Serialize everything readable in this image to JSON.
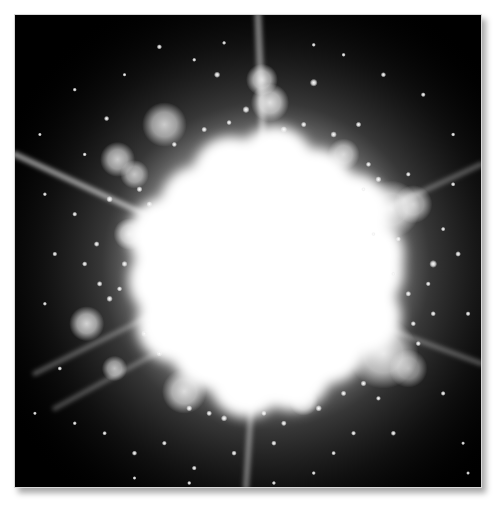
{
  "image": {
    "subject": "bright star cluster core with diffraction spikes",
    "palette": "grayscale",
    "frame": {
      "border_color": "#d8d8d8",
      "background": "#000000",
      "page_background": "#ffffff"
    },
    "core": {
      "cx": 252,
      "cy": 258,
      "radius": 118,
      "color": "#ffffff"
    },
    "glow": {
      "cx": 252,
      "cy": 252,
      "radius": 300
    },
    "spikes": [
      {
        "name": "spike-top",
        "x1": 244,
        "y1": 0,
        "x2": 250,
        "y2": 150,
        "width": 7,
        "opacity": 0.45
      },
      {
        "name": "spike-bottom",
        "x1": 232,
        "y1": 474,
        "x2": 240,
        "y2": 350,
        "width": 6,
        "opacity": 0.4
      },
      {
        "name": "spike-left-upper",
        "x1": 0,
        "y1": 140,
        "x2": 130,
        "y2": 200,
        "width": 6,
        "opacity": 0.55
      },
      {
        "name": "spike-left-lower-1",
        "x1": 20,
        "y1": 360,
        "x2": 140,
        "y2": 300,
        "width": 5,
        "opacity": 0.3
      },
      {
        "name": "spike-left-lower-2",
        "x1": 40,
        "y1": 395,
        "x2": 150,
        "y2": 335,
        "width": 5,
        "opacity": 0.28
      },
      {
        "name": "spike-right-upper",
        "x1": 468,
        "y1": 150,
        "x2": 360,
        "y2": 200,
        "width": 5,
        "opacity": 0.3
      },
      {
        "name": "spike-right-lower",
        "x1": 468,
        "y1": 350,
        "x2": 360,
        "y2": 310,
        "width": 5,
        "opacity": 0.3
      }
    ],
    "blobs": [
      {
        "cx": 248,
        "cy": 65,
        "r": 10,
        "o": 0.8
      },
      {
        "cx": 256,
        "cy": 88,
        "r": 12,
        "o": 0.85
      },
      {
        "cx": 103,
        "cy": 145,
        "r": 11,
        "o": 0.75
      },
      {
        "cx": 120,
        "cy": 160,
        "r": 9,
        "o": 0.7
      },
      {
        "cx": 378,
        "cy": 195,
        "r": 18,
        "o": 0.85
      },
      {
        "cx": 400,
        "cy": 190,
        "r": 12,
        "o": 0.7
      },
      {
        "cx": 345,
        "cy": 240,
        "r": 10,
        "o": 0.8
      },
      {
        "cx": 370,
        "cy": 340,
        "r": 22,
        "o": 0.85
      },
      {
        "cx": 395,
        "cy": 355,
        "r": 12,
        "o": 0.6
      },
      {
        "cx": 72,
        "cy": 310,
        "r": 11,
        "o": 0.8
      },
      {
        "cx": 100,
        "cy": 355,
        "r": 8,
        "o": 0.7
      },
      {
        "cx": 170,
        "cy": 378,
        "r": 14,
        "o": 0.8
      },
      {
        "cx": 290,
        "cy": 388,
        "r": 9,
        "o": 0.75
      },
      {
        "cx": 150,
        "cy": 110,
        "r": 14,
        "o": 0.75
      },
      {
        "cx": 330,
        "cy": 140,
        "r": 10,
        "o": 0.7
      },
      {
        "cx": 115,
        "cy": 220,
        "r": 10,
        "o": 0.8
      }
    ],
    "stars": [
      [
        145,
        32,
        1.5
      ],
      [
        180,
        45,
        1.2
      ],
      [
        203,
        60,
        1.8
      ],
      [
        232,
        95,
        2
      ],
      [
        92,
        104,
        1.5
      ],
      [
        60,
        75,
        1.2
      ],
      [
        300,
        68,
        2.2
      ],
      [
        330,
        40,
        1.2
      ],
      [
        370,
        60,
        1.5
      ],
      [
        410,
        80,
        1.4
      ],
      [
        440,
        120,
        1.2
      ],
      [
        420,
        250,
        2.2
      ],
      [
        445,
        240,
        1.6
      ],
      [
        455,
        300,
        1.4
      ],
      [
        420,
        300,
        1.5
      ],
      [
        395,
        280,
        1.6
      ],
      [
        380,
        260,
        1.5
      ],
      [
        405,
        330,
        1.5
      ],
      [
        430,
        380,
        1.4
      ],
      [
        380,
        420,
        1.5
      ],
      [
        340,
        420,
        1.4
      ],
      [
        320,
        440,
        1.3
      ],
      [
        300,
        460,
        1.2
      ],
      [
        260,
        430,
        1.5
      ],
      [
        220,
        440,
        1.5
      ],
      [
        180,
        455,
        1.4
      ],
      [
        150,
        430,
        1.4
      ],
      [
        120,
        440,
        1.5
      ],
      [
        90,
        420,
        1.3
      ],
      [
        60,
        410,
        1.2
      ],
      [
        45,
        355,
        1.3
      ],
      [
        30,
        290,
        1.2
      ],
      [
        40,
        240,
        1.4
      ],
      [
        70,
        250,
        1.5
      ],
      [
        85,
        270,
        1.6
      ],
      [
        95,
        285,
        1.8
      ],
      [
        82,
        230,
        1.6
      ],
      [
        60,
        200,
        1.4
      ],
      [
        30,
        180,
        1.2
      ],
      [
        95,
        185,
        1.8
      ],
      [
        125,
        175,
        1.7
      ],
      [
        135,
        190,
        1.6
      ],
      [
        320,
        120,
        1.8
      ],
      [
        345,
        110,
        1.6
      ],
      [
        355,
        150,
        1.5
      ],
      [
        365,
        165,
        1.7
      ],
      [
        350,
        175,
        1.5
      ],
      [
        395,
        160,
        1.4
      ],
      [
        290,
        110,
        1.6
      ],
      [
        270,
        115,
        1.8
      ],
      [
        215,
        108,
        1.5
      ],
      [
        190,
        115,
        1.6
      ],
      [
        160,
        130,
        1.5
      ],
      [
        110,
        250,
        1.7
      ],
      [
        105,
        275,
        1.5
      ],
      [
        130,
        320,
        1.8
      ],
      [
        145,
        340,
        1.6
      ],
      [
        175,
        395,
        1.7
      ],
      [
        195,
        400,
        1.6
      ],
      [
        210,
        405,
        1.8
      ],
      [
        250,
        400,
        1.5
      ],
      [
        270,
        410,
        1.6
      ],
      [
        305,
        395,
        1.8
      ],
      [
        330,
        380,
        1.6
      ],
      [
        350,
        370,
        1.7
      ],
      [
        365,
        385,
        1.4
      ],
      [
        400,
        310,
        1.5
      ],
      [
        415,
        270,
        1.4
      ],
      [
        430,
        215,
        1.3
      ],
      [
        440,
        170,
        1.3
      ],
      [
        385,
        225,
        1.4
      ],
      [
        360,
        220,
        1.4
      ],
      [
        300,
        30,
        1.2
      ],
      [
        210,
        28,
        1.2
      ],
      [
        110,
        60,
        1.1
      ],
      [
        70,
        140,
        1.2
      ],
      [
        25,
        120,
        1.1
      ],
      [
        20,
        400,
        1.1
      ],
      [
        450,
        430,
        1.1
      ],
      [
        455,
        460,
        1.1
      ],
      [
        260,
        470,
        1.2
      ],
      [
        120,
        465,
        1.1
      ],
      [
        175,
        470,
        1.2
      ]
    ]
  }
}
